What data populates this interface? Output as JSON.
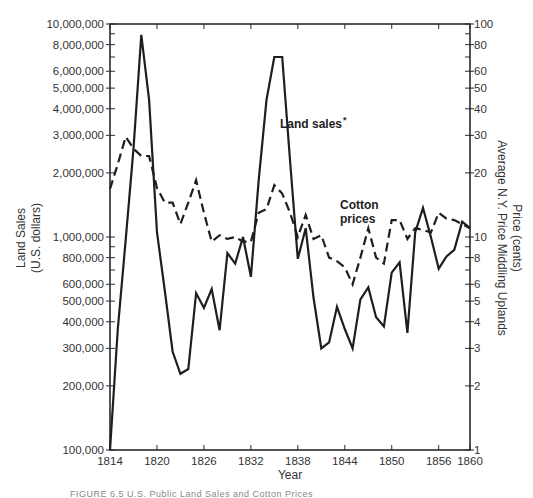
{
  "chart_data": {
    "type": "line",
    "title": "",
    "xlabel": "Year",
    "ylabel": "Land Sales\n(U.S. dollars)",
    "ylabel_right": "Price (cents)\nAverage N.Y. Price Middling Uplands",
    "x_range": [
      1814,
      1860
    ],
    "x_ticks": [
      1814,
      1820,
      1826,
      1832,
      1838,
      1844,
      1850,
      1856,
      1860
    ],
    "x_tick_labels": [
      "1814",
      "1820",
      "1826",
      "1832",
      "1838",
      "1844",
      "1850",
      "1856",
      "1860"
    ],
    "y_scale": "log",
    "ylim": [
      100000,
      10000000
    ],
    "y_tick_labels": [
      "100,000",
      "200,000",
      "300,000",
      "400,000",
      "500,000",
      "600,000",
      "800,000",
      "1,000,000",
      "2,000,000",
      "3,000,000",
      "4,000,000",
      "5,000,000",
      "6,000,000",
      "8,000,000",
      "10,000,000"
    ],
    "y_ticks": [
      100000,
      200000,
      300000,
      400000,
      500000,
      600000,
      800000,
      1000000,
      2000000,
      3000000,
      4000000,
      5000000,
      6000000,
      8000000,
      10000000
    ],
    "y_right_scale": "log",
    "ylim_right": [
      1,
      100
    ],
    "y_right_ticks": [
      1,
      2,
      3,
      4,
      5,
      6,
      8,
      10,
      20,
      30,
      40,
      50,
      60,
      80,
      100
    ],
    "y_right_tick_labels": [
      "1",
      "2",
      "3",
      "4",
      "5",
      "6",
      "8",
      "10",
      "20",
      "30",
      "40",
      "50",
      "60",
      "80",
      "100"
    ],
    "grid": false,
    "legend": "inline annotations",
    "x": [
      1814,
      1815,
      1816,
      1817,
      1818,
      1819,
      1820,
      1821,
      1822,
      1823,
      1824,
      1825,
      1826,
      1827,
      1828,
      1829,
      1830,
      1831,
      1832,
      1833,
      1834,
      1835,
      1836,
      1837,
      1838,
      1839,
      1840,
      1841,
      1842,
      1843,
      1844,
      1845,
      1846,
      1847,
      1848,
      1849,
      1850,
      1851,
      1852,
      1853,
      1854,
      1855,
      1856,
      1857,
      1858,
      1859,
      1860
    ],
    "series": [
      {
        "name": "Land sales",
        "label": "Land sales *",
        "axis": "left",
        "style": "solid",
        "values": [
          100000,
          370000,
          970000,
          2600000,
          8900000,
          4400000,
          1050000,
          560000,
          290000,
          228000,
          240000,
          545000,
          465000,
          570000,
          365000,
          840000,
          750000,
          1000000,
          650000,
          1850000,
          4400000,
          7000000,
          7000000,
          2300000,
          790000,
          1100000,
          520000,
          300000,
          320000,
          470000,
          370000,
          300000,
          510000,
          580000,
          420000,
          380000,
          680000,
          760000,
          355000,
          1050000,
          1370000,
          1000000,
          710000,
          810000,
          870000,
          1180000,
          1100000
        ]
      },
      {
        "name": "Cotton prices",
        "label": "Cotton prices",
        "axis": "right",
        "style": "dashed",
        "values": [
          16.8,
          22,
          29.5,
          26,
          24,
          24,
          17,
          14.5,
          14.5,
          11.5,
          14.5,
          18.5,
          13,
          9.5,
          10.2,
          9.8,
          10,
          9.5,
          9.5,
          13,
          13.5,
          17.5,
          16,
          13,
          10,
          12.7,
          9.8,
          10.2,
          8,
          7.7,
          7.2,
          6,
          8,
          11,
          8,
          7.5,
          12,
          12,
          9.8,
          11,
          10.8,
          10.5,
          13,
          12.2,
          12,
          11.5,
          11
        ]
      }
    ],
    "annotations": [
      {
        "text": "Land sales",
        "marker": "*",
        "near_x": 1838,
        "target": "Land sales"
      },
      {
        "text_lines": [
          "Cotton",
          "prices"
        ],
        "near_x": 1847,
        "target": "Cotton prices"
      }
    ]
  },
  "labels": {
    "x_title": "Year",
    "y_left_title_line1": "Land Sales",
    "y_left_title_line2": "(U.S. dollars)",
    "y_right_title_line1": "Price (cents)",
    "y_right_title_line2": "Average N.Y. Price Middling Uplands",
    "land_sales_label": "Land sales",
    "land_sales_marker": "*",
    "cotton_label_line1": "Cotton",
    "cotton_label_line2": "prices",
    "caption": "FIGURE 6.5   U.S. Public Land Sales and Cotton Prices"
  },
  "colors": {
    "line": "#1e1e1e",
    "axis": "#2a2a2a",
    "text": "#333333"
  }
}
